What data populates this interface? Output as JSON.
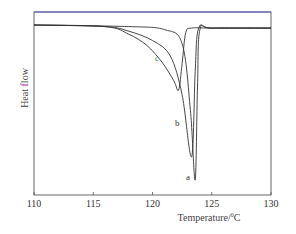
{
  "chart_data": {
    "type": "line",
    "title": "",
    "xlabel": "Temperature/°C",
    "xlabel_parts": {
      "text": "Temperature/",
      "sup": "0",
      "unit": "C"
    },
    "ylabel": "Heat flow",
    "ylabel_parts": {
      "before": "Heat ",
      "highlight": "f",
      "after": "low"
    },
    "xlim": [
      110,
      130
    ],
    "xticks": [
      110,
      115,
      120,
      125,
      130
    ],
    "yticks": [],
    "grid": false,
    "legend": "none (curves labeled inline a, b, c)",
    "colors": {
      "curves": "#333333",
      "top_line": "#5a5ad0",
      "label_c": "#3a9a3a",
      "ylabel_highlight": "#b03aa0"
    },
    "series": [
      {
        "name": "a",
        "description": "sharpest, deepest endotherm",
        "peak_temperature": 123.6,
        "onset_temperature": 121.5,
        "relative_depth": 1.0,
        "points": [
          [
            110,
            0
          ],
          [
            118,
            0.01
          ],
          [
            121,
            0.03
          ],
          [
            122.5,
            0.12
          ],
          [
            123.2,
            0.55
          ],
          [
            123.6,
            1.0
          ],
          [
            123.8,
            0.4
          ],
          [
            124,
            0.03
          ],
          [
            125,
            0.02
          ],
          [
            130,
            0.02
          ]
        ]
      },
      {
        "name": "b",
        "description": "intermediate endotherm",
        "peak_temperature": 123.3,
        "onset_temperature": 118.0,
        "relative_depth": 0.85,
        "points": [
          [
            110,
            0
          ],
          [
            116,
            0.01
          ],
          [
            118,
            0.04
          ],
          [
            120,
            0.1
          ],
          [
            121.5,
            0.2
          ],
          [
            122.5,
            0.45
          ],
          [
            123.3,
            0.85
          ],
          [
            123.6,
            0.3
          ],
          [
            123.9,
            0.02
          ],
          [
            125,
            0.02
          ],
          [
            130,
            0.02
          ]
        ]
      },
      {
        "name": "c",
        "description": "broadest, shallowest endotherm",
        "peak_temperature": 122.2,
        "onset_temperature": 116.5,
        "relative_depth": 0.42,
        "points": [
          [
            110,
            0
          ],
          [
            116,
            0.01
          ],
          [
            118,
            0.06
          ],
          [
            119.5,
            0.13
          ],
          [
            120.8,
            0.24
          ],
          [
            121.8,
            0.36
          ],
          [
            122.2,
            0.42
          ],
          [
            122.5,
            0.25
          ],
          [
            122.8,
            0.05
          ],
          [
            123.3,
            0.02
          ],
          [
            125,
            0.02
          ],
          [
            130,
            0.02
          ]
        ]
      }
    ],
    "annotations": [
      {
        "text": "a",
        "x": 123.1,
        "note": "below peak of a"
      },
      {
        "text": "b",
        "x": 122.1,
        "note": "left of curve b"
      },
      {
        "text": "c",
        "x": 120.2,
        "note": "left of curve c, green"
      }
    ]
  }
}
